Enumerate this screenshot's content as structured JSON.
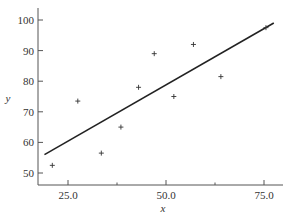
{
  "chart_data": {
    "type": "scatter",
    "title": "",
    "xlabel": "x",
    "ylabel": "y",
    "xlim": [
      17,
      79
    ],
    "ylim": [
      46,
      103
    ],
    "grid": false,
    "legend": null,
    "x_ticks": [
      25.0,
      50.0,
      75.0
    ],
    "x_tick_labels": [
      "25.0",
      "50.0",
      "75.0"
    ],
    "x_minor_ticks": [
      37.5,
      62.5
    ],
    "y_ticks": [
      50,
      60,
      70,
      80,
      90,
      100
    ],
    "y_tick_labels": [
      "50",
      "60",
      "70",
      "80",
      "90",
      "100"
    ],
    "series": [
      {
        "name": "observations",
        "marker": "+",
        "points": [
          {
            "x": 21.0,
            "y": 52.5
          },
          {
            "x": 27.5,
            "y": 73.5
          },
          {
            "x": 33.5,
            "y": 56.5
          },
          {
            "x": 38.5,
            "y": 65.0
          },
          {
            "x": 43.0,
            "y": 78.0
          },
          {
            "x": 47.0,
            "y": 89.0
          },
          {
            "x": 52.0,
            "y": 75.0
          },
          {
            "x": 57.0,
            "y": 92.0
          },
          {
            "x": 64.0,
            "y": 81.5
          },
          {
            "x": 75.5,
            "y": 97.5
          }
        ]
      },
      {
        "name": "fitted line",
        "type": "line",
        "points": [
          {
            "x": 19.0,
            "y": 56.0
          },
          {
            "x": 77.5,
            "y": 99.0
          }
        ]
      }
    ]
  },
  "axes": {
    "x_title": "x",
    "y_title": "y"
  }
}
